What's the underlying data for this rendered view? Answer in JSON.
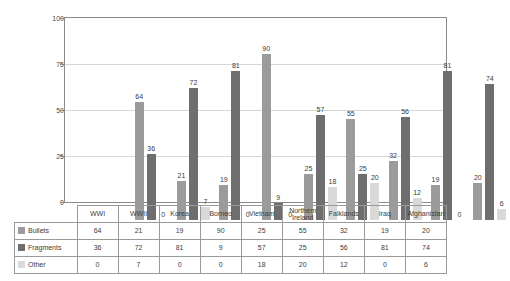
{
  "chart_data": {
    "type": "bar",
    "title": "",
    "subtitle": "",
    "xlabel": "",
    "ylabel": "",
    "ylim": [
      0,
      100
    ],
    "yticks": [
      0,
      25,
      50,
      75,
      100
    ],
    "grid": true,
    "legend_position": "table-left",
    "categories": [
      "WWI",
      "WWII",
      "Korea",
      "Borneo",
      "Vietnam",
      "Northern Ireland",
      "Falklands",
      "Iraq",
      "Afghanistan"
    ],
    "series": [
      {
        "name": "Bullets",
        "color": "#9b9b9b",
        "values": [
          64,
          21,
          19,
          90,
          25,
          55,
          32,
          19,
          20
        ]
      },
      {
        "name": "Fragments",
        "color": "#6e6e6e",
        "values": [
          36,
          72,
          81,
          9,
          57,
          25,
          56,
          81,
          74
        ]
      },
      {
        "name": "Other",
        "color": "#d9d9d9",
        "values": [
          0,
          7,
          0,
          0,
          18,
          20,
          12,
          0,
          6
        ]
      }
    ]
  },
  "table": {
    "column_headers": [
      "",
      "WWI",
      "WWII",
      "Korea",
      "Borneo",
      "Vietnam",
      "Northern Ireland",
      "Falklands",
      "Iraq",
      "Afghanistan"
    ],
    "rows": [
      {
        "label": "Bullets",
        "swatch": "#9b9b9b",
        "values": [
          "64",
          "21",
          "19",
          "90",
          "25",
          "55",
          "32",
          "19",
          "20"
        ]
      },
      {
        "label": "Fragments",
        "swatch": "#6e6e6e",
        "values": [
          "36",
          "72",
          "81",
          "9",
          "57",
          "25",
          "56",
          "81",
          "74"
        ]
      },
      {
        "label": "Other",
        "swatch": "#d9d9d9",
        "values": [
          "0",
          "7",
          "0",
          "0",
          "18",
          "20",
          "12",
          "0",
          "6"
        ]
      }
    ]
  },
  "axis": {
    "y_tick_labels": [
      "100",
      "75",
      "50",
      "25",
      "0"
    ]
  }
}
